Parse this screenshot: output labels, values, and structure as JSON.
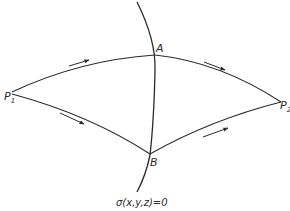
{
  "diagram": {
    "stroke_color": "#2a2a2a",
    "background": "#ffffff",
    "points": {
      "P1": {
        "label": "P",
        "subscript": "1"
      },
      "P2": {
        "label": "P",
        "subscript": "2"
      },
      "A": {
        "label": "A"
      },
      "B": {
        "label": "B"
      }
    },
    "surface_label": "σ(x,y,z)=0",
    "paths": [
      {
        "name": "upper-path",
        "from": "P1",
        "via": "A",
        "to": "P2"
      },
      {
        "name": "lower-path",
        "from": "P1",
        "via": "B",
        "to": "P2"
      }
    ],
    "arrows": [
      {
        "name": "arrow-p1-a",
        "direction": "P1→A"
      },
      {
        "name": "arrow-a-p2",
        "direction": "A→P2"
      },
      {
        "name": "arrow-p1-b",
        "direction": "P1→B"
      },
      {
        "name": "arrow-b-p2",
        "direction": "B→P2"
      }
    ]
  }
}
